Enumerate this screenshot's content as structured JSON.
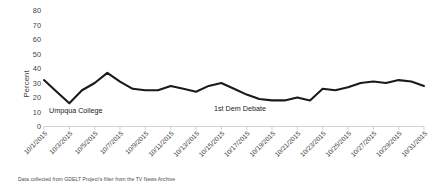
{
  "chart_data": {
    "type": "line",
    "title": "",
    "xlabel": "",
    "ylabel": "Percent",
    "ylim": [
      0,
      80
    ],
    "ytick_step": 10,
    "yticks": [
      0,
      10,
      20,
      30,
      40,
      50,
      60,
      70,
      80
    ],
    "grid": false,
    "legend": null,
    "legend_position": "none",
    "line_color": "#1a1a1a",
    "x": [
      "10/1/2015",
      "10/2/2015",
      "10/3/2015",
      "10/4/2015",
      "10/5/2015",
      "10/6/2015",
      "10/7/2015",
      "10/8/2015",
      "10/9/2015",
      "10/10/2015",
      "10/11/2015",
      "10/12/2015",
      "10/13/2015",
      "10/14/2015",
      "10/15/2015",
      "10/16/2015",
      "10/17/2015",
      "10/18/2015",
      "10/19/2015",
      "10/20/2015",
      "10/21/2015",
      "10/22/2015",
      "10/23/2015",
      "10/24/2015",
      "10/25/2015",
      "10/26/2015",
      "10/27/2015",
      "10/28/2015",
      "10/29/2015",
      "10/30/2015",
      "10/31/2015"
    ],
    "xtick_labels": [
      "10/1/2015",
      "10/3/2015",
      "10/5/2015",
      "10/7/2015",
      "10/9/2015",
      "10/11/2015",
      "10/13/2015",
      "10/15/2015",
      "10/17/2015",
      "10/19/2015",
      "10/21/2015",
      "10/23/2015",
      "10/25/2015",
      "10/27/2015",
      "10/29/2015",
      "10/31/2015"
    ],
    "values": [
      32,
      24,
      16,
      25,
      30,
      37,
      31,
      26,
      25,
      25,
      28,
      26,
      24,
      28,
      30,
      26,
      22,
      19,
      18,
      18,
      20,
      18,
      26,
      25,
      27,
      30,
      31,
      30,
      32,
      31,
      28
    ],
    "series": [
      {
        "name": "Percent",
        "values": [
          32,
          24,
          16,
          25,
          30,
          37,
          31,
          26,
          25,
          25,
          28,
          26,
          24,
          28,
          30,
          26,
          22,
          19,
          18,
          18,
          20,
          18,
          26,
          25,
          27,
          30,
          31,
          30,
          32,
          31,
          28
        ]
      }
    ],
    "annotations": [
      {
        "text": "Umpqua College",
        "x": "10/3/2015",
        "y": 10
      },
      {
        "text": "1st Dem Debate",
        "x": "10/18/2015",
        "y": 14
      }
    ],
    "caption": "Data collected from GDELT Project's filter from the TV News Archive"
  }
}
